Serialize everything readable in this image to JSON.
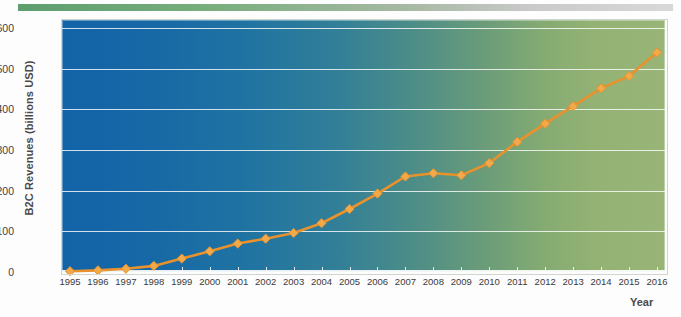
{
  "chart_data": {
    "type": "line",
    "title": "",
    "subtitle": "",
    "xlabel": "Year",
    "ylabel": "B2C Revenues (billions USD)",
    "categories": [
      "1995",
      "1996",
      "1997",
      "1998",
      "1999",
      "2000",
      "2001",
      "2002",
      "2003",
      "2004",
      "2005",
      "2006",
      "2007",
      "2008",
      "2009",
      "2010",
      "2011",
      "2012",
      "2013",
      "2014",
      "2015",
      "2016"
    ],
    "x": [
      1995,
      1996,
      1997,
      1998,
      1999,
      2000,
      2001,
      2002,
      2003,
      2004,
      2005,
      2006,
      2007,
      2008,
      2009,
      2010,
      2011,
      2012,
      2013,
      2014,
      2015,
      2016
    ],
    "series": [
      {
        "name": "B2C Revenues",
        "values": [
          2,
          4,
          8,
          15,
          33,
          51,
          70,
          82,
          96,
          120,
          155,
          193,
          235,
          243,
          238,
          268,
          320,
          365,
          408,
          452,
          482,
          540
        ],
        "color": "#e8922e",
        "marker": "diamond",
        "marker_color": "#f2a94a"
      }
    ],
    "ylim": [
      0,
      620
    ],
    "yticks": [
      0,
      100,
      200,
      300,
      400,
      500,
      600
    ],
    "ytick_labels": [
      "0",
      "100",
      "200",
      "300",
      "400",
      "500",
      "600"
    ],
    "xlim": [
      1995,
      2016
    ],
    "grid": "horizontal",
    "legend": "none",
    "plot_background": "linear blue-to-green horizontal gradient",
    "colors": {
      "plot_left": "#1363a8",
      "plot_right": "#98b577",
      "gridline": "#ffffff",
      "series": "#e8922e",
      "top_bar_left": "#5d9e6e",
      "top_bar_right": "#d8d8d8"
    },
    "annotations": []
  }
}
